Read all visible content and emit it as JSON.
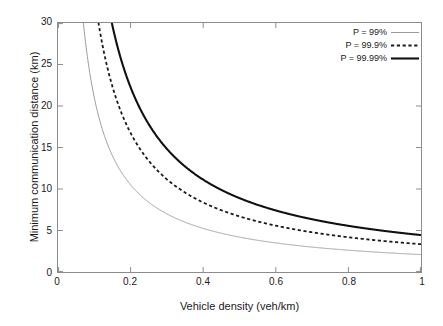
{
  "chart_data": {
    "type": "line",
    "title": "",
    "xlabel": "Vehicle density (veh/km)",
    "ylabel": "Minimum communication distance (km)",
    "xlim": [
      0,
      1
    ],
    "ylim": [
      0,
      30
    ],
    "xticks": [
      "0",
      "0.2",
      "0.4",
      "0.6",
      "0.8",
      "1"
    ],
    "xtick_values": [
      0,
      0.2,
      0.4,
      0.6,
      0.8,
      1
    ],
    "yticks": [
      "0",
      "5",
      "10",
      "15",
      "20",
      "25",
      "30"
    ],
    "ytick_values": [
      0,
      5,
      10,
      15,
      20,
      25,
      30
    ],
    "grid": false,
    "legend_position": "top-right",
    "x": [
      0.05,
      0.07,
      0.1,
      0.135,
      0.15,
      0.2,
      0.25,
      0.3,
      0.35,
      0.4,
      0.45,
      0.5,
      0.55,
      0.6,
      0.65,
      0.7,
      0.75,
      0.8,
      0.85,
      0.9,
      0.95,
      1.0
    ],
    "series": [
      {
        "name": "P = 99%",
        "label": "P = 99%",
        "style": "solid-thin",
        "color": "#9a9a9a",
        "width": 1.0,
        "coefficient": 2.1,
        "values": [
          42.0,
          30.0,
          21.0,
          15.6,
          14.0,
          10.5,
          8.4,
          7.0,
          6.0,
          5.3,
          4.7,
          4.2,
          3.8,
          3.5,
          3.2,
          3.0,
          2.8,
          2.6,
          2.5,
          2.3,
          2.2,
          2.1
        ]
      },
      {
        "name": "P = 99.9%",
        "label": "P = 99.9%",
        "style": "dashed",
        "color": "#1a1a1a",
        "width": 1.8,
        "coefficient": 3.35,
        "values": [
          67.0,
          47.9,
          33.5,
          24.8,
          22.3,
          16.8,
          13.4,
          11.2,
          9.6,
          8.4,
          7.4,
          6.7,
          6.1,
          5.6,
          5.2,
          4.8,
          4.5,
          4.2,
          3.9,
          3.7,
          3.5,
          3.35
        ]
      },
      {
        "name": "P = 99.99%",
        "label": "P = 99.99%",
        "style": "solid-thick",
        "color": "#111111",
        "width": 2.1,
        "coefficient": 4.45,
        "values": [
          89.0,
          63.6,
          44.5,
          33.0,
          29.7,
          22.3,
          17.8,
          14.8,
          12.7,
          11.1,
          9.9,
          8.9,
          8.1,
          7.4,
          6.8,
          6.4,
          5.9,
          5.6,
          5.2,
          4.9,
          4.7,
          4.45
        ]
      }
    ]
  },
  "legend": {
    "items": [
      {
        "label": "P = 99%"
      },
      {
        "label": "P = 99.9%"
      },
      {
        "label": "P = 99.99%"
      }
    ]
  },
  "axes": {
    "x_title": "Vehicle density (veh/km)",
    "y_title": "Minimum communication distance (km)"
  }
}
